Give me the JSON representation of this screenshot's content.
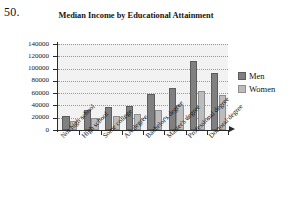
{
  "question_number": "50.",
  "chart_data": {
    "type": "bar",
    "title": "Median Income by Educational Attainment",
    "xlabel": "",
    "ylabel": "",
    "ylim": [
      0,
      140000
    ],
    "ytick_values": [
      0,
      20000,
      40000,
      60000,
      80000,
      100000,
      120000,
      140000
    ],
    "ytick_labels": [
      "0",
      "20000",
      "40000",
      "60000",
      "80000",
      "100000",
      "120000",
      "140000"
    ],
    "grid": true,
    "legend_position": "right",
    "categories": [
      "Not high school",
      "High school",
      "Some college",
      "AA degree",
      "Bachelor's degree",
      "Master's degree",
      "Professional degree",
      "Doctoral degree"
    ],
    "series": [
      {
        "name": "Men",
        "color": "#808080",
        "values": [
          23000,
          32000,
          38000,
          39000,
          59000,
          68000,
          113000,
          93000
        ]
      },
      {
        "name": "Women",
        "color": "#bcbcbc",
        "values": [
          14000,
          20000,
          23000,
          26000,
          33000,
          41000,
          64000,
          57000
        ]
      }
    ]
  }
}
